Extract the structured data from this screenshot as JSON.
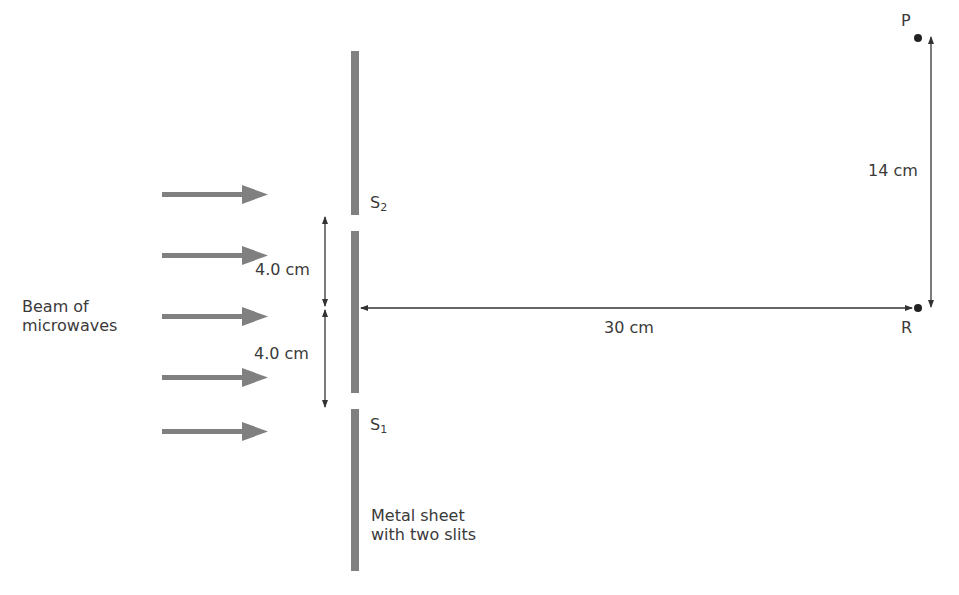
{
  "labels": {
    "beam_line1": "Beam of",
    "beam_line2": "microwaves",
    "s2_letter": "S",
    "s2_sub": "2",
    "s1_letter": "S",
    "s1_sub": "1",
    "spacing_upper": "4.0 cm",
    "spacing_lower": "4.0 cm",
    "distance_horizontal": "30 cm",
    "distance_vertical": "14 cm",
    "point_p": "P",
    "point_r": "R",
    "sheet_line1": "Metal sheet",
    "sheet_line2": "with two slits"
  },
  "colors": {
    "sheet": "#808080",
    "beam_arrow": "#808080",
    "dimension_line": "#333333",
    "text": "#3a3a3a"
  }
}
